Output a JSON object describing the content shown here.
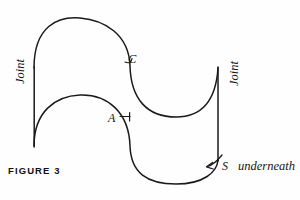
{
  "figure": {
    "caption": "FIGURE 3",
    "type": "line-diagram",
    "stroke_color": "#1a1a1a",
    "background_color": "#fefefe"
  },
  "labels": {
    "joint_left": "Joint",
    "joint_right": "Joint",
    "point_c": "C",
    "point_a": "A",
    "point_s": "S",
    "underneath": "underneath"
  },
  "geometry": {
    "upper_curve": "M34,68 C34,24 60,16 80,18 C104,20 128,34 130,66 C132,98 146,116 176,116 C202,116 216,98 218,68",
    "lower_curve": "M34,146 C34,112 56,96 80,95 C108,94 130,112 130,146 C130,172 146,184 176,184 C204,184 218,172 218,160",
    "joint_left_line": "M34,68 L34,146",
    "joint_right_line": "M218,68 L218,160",
    "tick_c": "M126,60 C130,62 132,64 133,58",
    "tick_a": "M118,116 L130,116 M130,112 L130,120",
    "arrow_s": "M221,156 C216,160 212,164 206,166"
  }
}
